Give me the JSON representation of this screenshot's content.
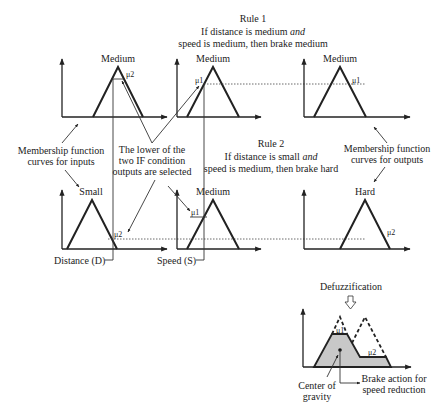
{
  "rule1": {
    "title": "Rule 1",
    "line1_pre": "If distance is medium ",
    "line1_em": "and",
    "line2": "speed is medium, then brake medium",
    "distance_set": "Medium",
    "speed_set": "Medium",
    "output_set": "Medium",
    "mu_distance": "μ2",
    "mu_speed": "μ1",
    "mu_output": "μ1"
  },
  "rule2": {
    "title": "Rule 2",
    "line1_pre": "If distance is small ",
    "line1_em": "and",
    "line2": "speed is medium, then brake hard",
    "distance_set": "Small",
    "speed_set": "Medium",
    "output_set": "Hard",
    "mu_distance": "μ2",
    "mu_speed": "μ1",
    "mu_output": "μ2"
  },
  "annotations": {
    "inputs_line1": "Membership function",
    "inputs_line2": "curves for inputs",
    "outputs_line1": "Membership function",
    "outputs_line2": "curves for outputs",
    "lower_line1": "The lower of the",
    "lower_line2": "two IF condition",
    "lower_line3": "outputs are selected",
    "distance_axis": "Distance (D)",
    "speed_axis": "Speed (S)"
  },
  "defuzz": {
    "title": "Defuzzification",
    "mu1": "μ1",
    "mu2": "μ2",
    "cog_line1": "Center of",
    "cog_line2": "gravity",
    "brake_line1": "Brake action for",
    "brake_line2": "speed reduction"
  }
}
